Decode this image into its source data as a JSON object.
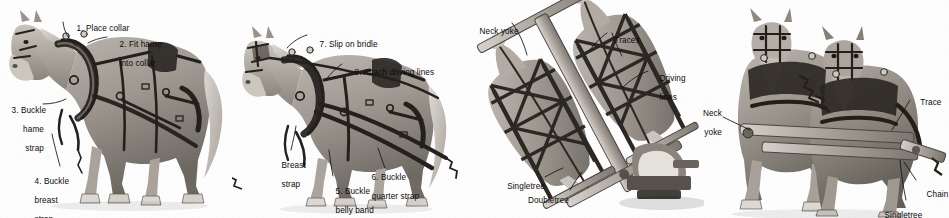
{
  "figure": {
    "background_color": "#ffffff",
    "label_color": "#0b0b0b",
    "illustration_style": "grayscale pencil halftone",
    "width": 949,
    "height": 218
  },
  "panels": [
    {
      "id": "panel-1",
      "name": "collar-and-hames",
      "subject": "Single draft horse, left side view, wearing collar and harness",
      "labels": [
        {
          "id": "p1-l1",
          "text": "1. Place collar",
          "lines": [
            "1. Place collar"
          ]
        },
        {
          "id": "p1-l2",
          "text": "2. Fit hame into collar",
          "lines": [
            "2. Fit hame",
            "into collar"
          ]
        },
        {
          "id": "p1-l3",
          "text": "3. Buckle hame strap",
          "lines": [
            "3. Buckle",
            "hame",
            "strap"
          ]
        },
        {
          "id": "p1-l4",
          "text": "4. Buckle breast strap",
          "lines": [
            "4. Buckle",
            "breast",
            "strap"
          ]
        }
      ]
    },
    {
      "id": "panel-2",
      "name": "bridle-and-lines",
      "subject": "Single draft horse, left side view, fully harnessed with bridle and driving lines",
      "labels": [
        {
          "id": "p2-l7",
          "text": "7. Slip on bridle",
          "lines": [
            "7. Slip on bridle"
          ]
        },
        {
          "id": "p2-l8",
          "text": "8. Attach driving lines",
          "lines": [
            "8. Attach driving lines"
          ]
        },
        {
          "id": "p2-l9",
          "text": "Breast strap",
          "lines": [
            "Breast",
            "strap"
          ]
        },
        {
          "id": "p2-l5",
          "text": "5. Buckle belly band",
          "lines": [
            "5. Buckle",
            "belly band"
          ]
        },
        {
          "id": "p2-l6",
          "text": "6. Buckle quarter strap",
          "lines": [
            "6. Buckle",
            "quarter strap"
          ]
        }
      ]
    },
    {
      "id": "panel-3",
      "name": "overhead-hitch",
      "subject": "Overhead view of two hitched horses showing traces, singletrees and doubletree on an implement",
      "labels": [
        {
          "id": "p3-l1",
          "text": "Neck yoke",
          "lines": [
            "Neck yoke"
          ]
        },
        {
          "id": "p3-l2",
          "text": "Traces",
          "lines": [
            "Traces"
          ]
        },
        {
          "id": "p3-l3",
          "text": "Driving lines",
          "lines": [
            "Driving",
            "lines"
          ]
        },
        {
          "id": "p3-l4",
          "text": "Singletree",
          "lines": [
            "Singletree"
          ]
        },
        {
          "id": "p3-l5",
          "text": "Doubletree",
          "lines": [
            "Doubletree"
          ]
        }
      ]
    },
    {
      "id": "panel-4",
      "name": "front-view-team",
      "subject": "Front view of a hitched two-horse team showing neck yoke, trace, chain and singletree",
      "labels": [
        {
          "id": "p4-l1",
          "text": "Neck yoke",
          "lines": [
            "Neck",
            "yoke"
          ]
        },
        {
          "id": "p4-l2",
          "text": "Trace",
          "lines": [
            "Trace"
          ]
        },
        {
          "id": "p4-l3",
          "text": "Chain",
          "lines": [
            "Chain"
          ]
        },
        {
          "id": "p4-l4",
          "text": "Singletree",
          "lines": [
            "Singletree"
          ]
        }
      ]
    }
  ]
}
